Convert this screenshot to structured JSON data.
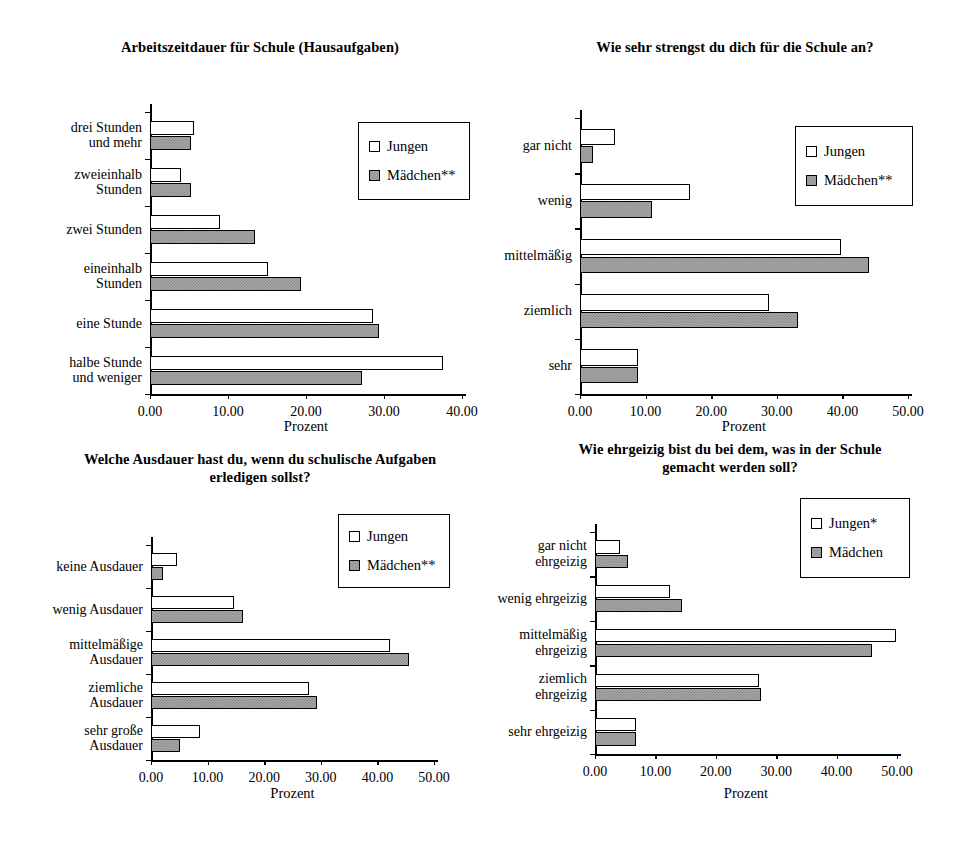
{
  "page": {
    "width": 972,
    "height": 855,
    "background": "#ffffff",
    "ink": "#000000",
    "series_fill_jungen": "#ffffff",
    "series_fill_maedchen": "#a6a6a6"
  },
  "chart_data": [
    {
      "id": "chart-hausaufgaben",
      "type": "bar",
      "orientation": "horizontal",
      "title": "Arbeitszeitdauer für Schule (Hausaufgaben)",
      "xlabel": "Prozent",
      "ylabel": "",
      "xlim": [
        0,
        40
      ],
      "xticks": [
        "0.00",
        "10.00",
        "20.00",
        "30.00",
        "40.00"
      ],
      "xtick_values": [
        0,
        10,
        20,
        30,
        40
      ],
      "grid": false,
      "legend_position": "top-right",
      "legend": [
        "Jungen",
        "Mädchen**"
      ],
      "categories": [
        "drei Stunden\nund mehr",
        "zweieinhalb\nStunden",
        "zwei Stunden",
        "eineinhalb\nStunden",
        "eine Stunde",
        "halbe Stunde\nund weniger"
      ],
      "series": [
        {
          "name": "Jungen",
          "values": [
            5.6,
            4.0,
            9.0,
            15.1,
            28.6,
            37.6
          ]
        },
        {
          "name": "Mädchen**",
          "values": [
            5.3,
            5.3,
            13.4,
            19.3,
            29.3,
            27.2
          ]
        }
      ]
    },
    {
      "id": "chart-anstrengung",
      "type": "bar",
      "orientation": "horizontal",
      "title": "Wie sehr strengst du dich für die Schule an?",
      "xlabel": "Prozent",
      "ylabel": "",
      "xlim": [
        0,
        50
      ],
      "xticks": [
        "0.00",
        "10.00",
        "20.00",
        "30.00",
        "40.00",
        "50.00"
      ],
      "xtick_values": [
        0,
        10,
        20,
        30,
        40,
        50
      ],
      "grid": false,
      "legend_position": "top-right",
      "legend": [
        "Jungen",
        "Mädchen**"
      ],
      "categories": [
        "gar nicht",
        "wenig",
        "mittelmäßig",
        "ziemlich",
        "sehr"
      ],
      "series": [
        {
          "name": "Jungen",
          "values": [
            5.3,
            16.8,
            39.8,
            28.8,
            8.8
          ]
        },
        {
          "name": "Mädchen**",
          "values": [
            2.0,
            11.0,
            44.0,
            33.3,
            8.8
          ]
        }
      ]
    },
    {
      "id": "chart-ausdauer",
      "type": "bar",
      "orientation": "horizontal",
      "title": "Welche Ausdauer hast du, wenn du schulische Aufgaben erledigen sollst?",
      "title_lines": [
        "Welche Ausdauer hast du, wenn du schulische Aufgaben",
        "erledigen sollst?"
      ],
      "xlabel": "Prozent",
      "ylabel": "",
      "xlim": [
        0,
        50
      ],
      "xticks": [
        "0.00",
        "10.00",
        "20.00",
        "30.00",
        "40.00",
        "50.00"
      ],
      "xtick_values": [
        0,
        10,
        20,
        30,
        40,
        50
      ],
      "grid": false,
      "legend_position": "top-right",
      "legend": [
        "Jungen",
        "Mädchen**"
      ],
      "categories": [
        "keine Ausdauer",
        "wenig Ausdauer",
        "mittelmäßige\nAusdauer",
        "ziemliche\nAusdauer",
        "sehr große\nAusdauer"
      ],
      "series": [
        {
          "name": "Jungen",
          "values": [
            4.6,
            14.7,
            42.3,
            28.0,
            8.6
          ]
        },
        {
          "name": "Mädchen**",
          "values": [
            2.2,
            16.2,
            45.5,
            29.4,
            5.2
          ]
        }
      ]
    },
    {
      "id": "chart-ehrgeiz",
      "type": "bar",
      "orientation": "horizontal",
      "title": "Wie ehrgeizig bist du bei dem, was in der Schule gemacht werden soll?",
      "title_lines": [
        "Wie ehrgeizig bist du bei dem, was in der Schule",
        "gemacht werden soll?"
      ],
      "xlabel": "Prozent",
      "ylabel": "",
      "xlim": [
        0,
        50
      ],
      "xticks": [
        "0.00",
        "10.00",
        "20.00",
        "30.00",
        "40.00",
        "50.00"
      ],
      "xtick_values": [
        0,
        10,
        20,
        30,
        40,
        50
      ],
      "grid": false,
      "legend_position": "top-right",
      "legend": [
        "Jungen*",
        "Mädchen"
      ],
      "categories": [
        "gar nicht\nehrgeizig",
        "wenig ehrgeizig",
        "mittelmäßig\nehrgeizig",
        "ziemlich\nehrgeizig",
        "sehr ehrgeizig"
      ],
      "series": [
        {
          "name": "Jungen*",
          "values": [
            4.2,
            12.4,
            49.8,
            27.1,
            6.8
          ]
        },
        {
          "name": "Mädchen",
          "values": [
            5.4,
            14.4,
            45.9,
            27.5,
            6.8
          ]
        }
      ]
    }
  ],
  "layout": [
    {
      "panel_left": 0,
      "panel_top": 30,
      "panel_width": 490,
      "panel_height": 410,
      "title_top": 8,
      "title_left": 60,
      "title_width": 400,
      "plot_left": 150,
      "plot_top": 82,
      "plot_width": 312,
      "plot_height": 282,
      "legend_left": 358,
      "legend_top": 92,
      "legend_width": 112,
      "legend_height": 78,
      "xaxis_title_top": 388
    },
    {
      "panel_left": 490,
      "panel_top": 30,
      "panel_width": 482,
      "panel_height": 410,
      "title_top": 8,
      "title_left": 45,
      "title_width": 400,
      "plot_left": 90,
      "plot_top": 88,
      "plot_width": 328,
      "plot_height": 276,
      "legend_left": 305,
      "legend_top": 96,
      "legend_width": 118,
      "legend_height": 80,
      "xaxis_title_top": 388
    },
    {
      "panel_left": 0,
      "panel_top": 440,
      "panel_width": 490,
      "panel_height": 415,
      "title_top": 10,
      "title_left": 50,
      "title_width": 420,
      "plot_left": 151,
      "plot_top": 105,
      "plot_width": 283,
      "plot_height": 215,
      "legend_left": 338,
      "legend_top": 74,
      "legend_width": 112,
      "legend_height": 74,
      "xaxis_title_top": 345
    },
    {
      "panel_left": 490,
      "panel_top": 440,
      "panel_width": 482,
      "panel_height": 415,
      "title_top": 0,
      "title_left": 30,
      "title_width": 420,
      "plot_left": 105,
      "plot_top": 92,
      "plot_width": 302,
      "plot_height": 222,
      "legend_left": 310,
      "legend_top": 58,
      "legend_width": 110,
      "legend_height": 80,
      "xaxis_title_top": 345
    }
  ]
}
